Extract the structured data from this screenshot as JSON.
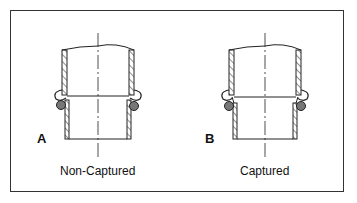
{
  "figure": {
    "panels": [
      {
        "letter": "A",
        "caption": "Non-Captured"
      },
      {
        "letter": "B",
        "caption": "Captured"
      }
    ],
    "colors": {
      "line": "#222222",
      "seal": "#777777",
      "border": "#333333"
    }
  }
}
